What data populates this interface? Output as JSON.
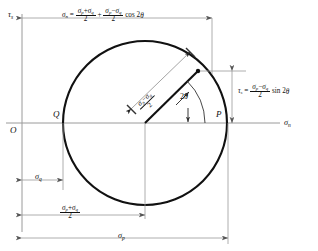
{
  "figure": {
    "type": "mohrs-circle-diagram",
    "title_implicit": "Mohr's circle for plane stress",
    "axes": {
      "horizontal_label": "σ",
      "horizontal_label_sub": "n",
      "vertical_label": "τ",
      "vertical_label_sub": "s",
      "origin_label": "O"
    },
    "points": {
      "left_label": "Q",
      "right_label": "P"
    },
    "angle_label": {
      "value": "2",
      "symbol": "θ"
    },
    "equations": {
      "sigma_n": {
        "lhs": "σ",
        "lhs_sub": "n",
        "eq": "=",
        "term1_num": "σ",
        "term1_num_sub_a": "p",
        "term1_num_plus": "+",
        "term1_num_b": "σ",
        "term1_num_sub_b": "q",
        "term1_den": "2",
        "plus": "+",
        "term2_num_a": "σ",
        "term2_num_sub_a": "p",
        "term2_num_minus": "−",
        "term2_num_b": "σ",
        "term2_num_sub_b": "q",
        "term2_den": "2",
        "trig": "cos 2",
        "trig_angle": "θ"
      },
      "tau_s": {
        "lhs": "τ",
        "lhs_sub": "s",
        "eq": "=",
        "num_a": "σ",
        "num_sub_a": "p",
        "num_minus": "−",
        "num_b": "σ",
        "num_sub_b": "q",
        "den": "2",
        "trig": "sin 2",
        "trig_angle": "θ"
      },
      "radius": {
        "num_a": "σ",
        "num_sub_a": "p",
        "num_minus": "−",
        "num_b": "σ",
        "num_sub_b": "q",
        "den": "2"
      }
    },
    "dimensions": {
      "sigma_q": {
        "symbol": "σ",
        "sub": "q"
      },
      "center_avg": {
        "num_a": "σ",
        "num_sub_a": "p",
        "num_plus": "+",
        "num_b": "σ",
        "num_sub_b": "q",
        "den": "2"
      },
      "sigma_p": {
        "symbol": "σ",
        "sub": "p"
      }
    },
    "colors": {
      "ink": "#111111",
      "thin_line": "#8d8d8d",
      "background": "#ffffff"
    },
    "geometry": {
      "circle_center_x": 145,
      "circle_center_y": 123,
      "circle_radius": 82,
      "axis_y": 123,
      "origin_x": 22,
      "point_on_circle_x": 197,
      "point_on_circle_y": 72
    }
  }
}
